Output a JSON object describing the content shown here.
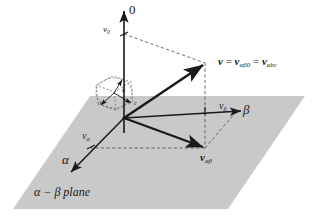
{
  "figure": {
    "kind": "vector-space-diagram",
    "caption": "α − β plane",
    "colors": {
      "plane_fill": "#c9c9c9",
      "stroke": "#1a1a1a",
      "dashed_stroke": "#4d4d4d",
      "background": "#ffffff"
    }
  },
  "labels": {
    "axis_zero": "0",
    "axis_alpha": "α",
    "axis_beta": "β",
    "v_zero_base": "v",
    "v_zero_sub": "0",
    "v_alpha_base": "v",
    "v_alpha_sub": "α",
    "v_beta_base": "v",
    "v_beta_sub": "β",
    "main_vector_bold": "v",
    "main_vector_eq1": " = ",
    "main_vector_term2_bold": "v",
    "main_vector_term2_sub": "αβ0",
    "main_vector_eq2": " = ",
    "main_vector_term3_bold": "v",
    "main_vector_term3_sub": "abc",
    "v_alphabeta_bold": "v",
    "v_alphabeta_sub": "αβ",
    "plane_caption": "α − β plane",
    "cube_a": "a",
    "cube_b": "b",
    "cube_c": "c"
  },
  "geometry": {
    "origin": [
      124,
      118
    ],
    "zero_axis_tip": [
      124,
      12
    ],
    "v_zero_point": [
      124,
      34
    ],
    "main_vector_tip": [
      205,
      63
    ],
    "v_alphabeta_point": [
      205,
      148
    ],
    "beta_axis_tip": [
      240,
      111
    ],
    "v_beta_point": [
      205,
      111
    ],
    "alpha_axis_tip": [
      73,
      169
    ],
    "v_alpha_point": [
      91,
      145
    ],
    "plane_polygon": "90,96 305,96 228,209 13,209"
  }
}
